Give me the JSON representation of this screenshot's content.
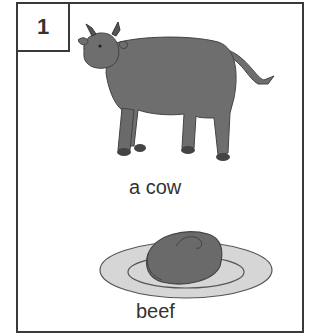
{
  "card": {
    "number": "1",
    "items": [
      {
        "label": "a cow",
        "icon": "cow-icon"
      },
      {
        "label": "beef",
        "icon": "beef-steak-icon"
      }
    ]
  },
  "colors": {
    "border": "#3a3a3a",
    "animal_fill": "#6e6e6e",
    "plate_fill": "#d6d6d6",
    "meat_fill": "#6a6a6a"
  }
}
